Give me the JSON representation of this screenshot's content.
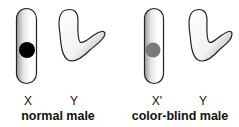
{
  "panels": [
    {
      "caption": "normal male",
      "chromosomes": [
        {
          "label": "X",
          "type": "x-chromosome",
          "marker": "black-dot",
          "marker_color": "#000000"
        },
        {
          "label": "Y",
          "type": "y-chromosome"
        }
      ]
    },
    {
      "caption": "color-blind male",
      "chromosomes": [
        {
          "label": "X'",
          "type": "x-chromosome",
          "marker": "grey-dot",
          "marker_color": "#7a7a7a"
        },
        {
          "label": "Y",
          "type": "y-chromosome"
        }
      ]
    }
  ]
}
